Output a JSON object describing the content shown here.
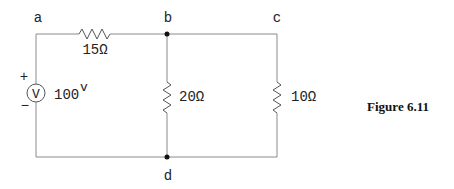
{
  "figure": {
    "caption": "Figure 6.11"
  },
  "nodes": {
    "a": "a",
    "b": "b",
    "c": "c",
    "d": "d"
  },
  "components": {
    "r1": {
      "label": "15Ω",
      "value_ohms": 15,
      "between": [
        "a",
        "b"
      ]
    },
    "r2": {
      "label": "20Ω",
      "value_ohms": 20,
      "between": [
        "b",
        "d"
      ]
    },
    "r3": {
      "label": "10Ω",
      "value_ohms": 10,
      "between": [
        "c",
        "d"
      ]
    },
    "source": {
      "label": "100",
      "unit": "v",
      "symbol": "V",
      "plus": "+",
      "minus": "−",
      "value_volts": 100
    }
  },
  "colors": {
    "wire": "#8a8a8a",
    "text": "#222222"
  }
}
